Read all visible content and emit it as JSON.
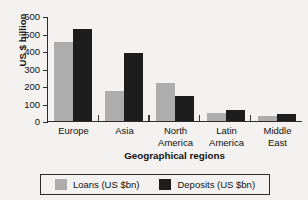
{
  "chart_data": {
    "type": "bar",
    "title": "",
    "xlabel": "Geographical regions",
    "ylabel": "US $ billion",
    "categories": [
      "Europe",
      "Asia",
      "North America",
      "Latin America",
      "Middle East"
    ],
    "series": [
      {
        "name": "Loans (US $bn)",
        "color": "#adadad",
        "values": [
          455,
          170,
          220,
          45,
          25
        ]
      },
      {
        "name": "Deposits (US $bn)",
        "color": "#1d1d1d",
        "values": [
          530,
          390,
          140,
          60,
          40
        ]
      }
    ],
    "ylim": [
      0,
      600
    ],
    "ytick_step": 100,
    "yticks": [
      0,
      100,
      200,
      300,
      400,
      500,
      600
    ],
    "grid": false,
    "legend_position": "bottom"
  },
  "axes": {
    "y_title": "US $ billion",
    "x_title": "Geographical regions",
    "y_tick_labels": [
      "600",
      "500",
      "400",
      "300",
      "200",
      "100",
      "0"
    ],
    "x_tick_labels": [
      [
        "Europe"
      ],
      [
        "Asia"
      ],
      [
        "North",
        "America"
      ],
      [
        "Latin",
        "America"
      ],
      [
        "Middle",
        "East"
      ]
    ]
  },
  "legend": {
    "items": [
      {
        "label": "Loans (US $bn)",
        "color": "#adadad",
        "icon": "legend-swatch-gray"
      },
      {
        "label": "Deposits (US $bn)",
        "color": "#1d1d1d",
        "icon": "legend-swatch-black"
      }
    ]
  },
  "colors": {
    "loans": "#adadad",
    "deposits": "#1d1d1d",
    "axis": "#2c2c2c",
    "background": "#f3f2f0"
  }
}
